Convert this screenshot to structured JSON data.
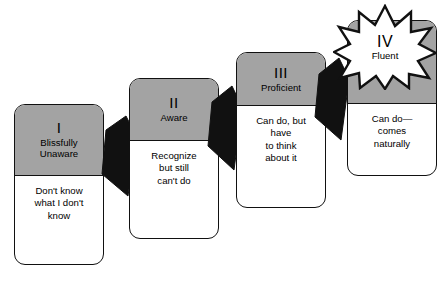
{
  "diagram": {
    "colors": {
      "header_gray": "#a3a3a3",
      "body_white": "#ffffff",
      "outline_black": "#111111",
      "arrow_black": "#111111"
    },
    "stages": [
      {
        "roman": "I",
        "label": "Blissfully\nUnaware",
        "description": "Don't know\nwhat I don't\nknow",
        "highlighted": false
      },
      {
        "roman": "II",
        "label": "Aware",
        "description": "Recognize\nbut still\ncan't do",
        "highlighted": false
      },
      {
        "roman": "III",
        "label": "Proficient",
        "description": "Can do, but\nhave\nto think\nabout it",
        "highlighted": false
      },
      {
        "roman": "IV",
        "label": "Fluent",
        "description": "Can do—\ncomes\nnaturally",
        "highlighted": true
      }
    ],
    "arrows": [
      {
        "name": "arrow-stage-1-to-2"
      },
      {
        "name": "arrow-stage-2-to-3"
      },
      {
        "name": "arrow-stage-3-to-4"
      }
    ],
    "starburst": {
      "roman": "IV",
      "label": "Fluent",
      "points": 12
    }
  }
}
